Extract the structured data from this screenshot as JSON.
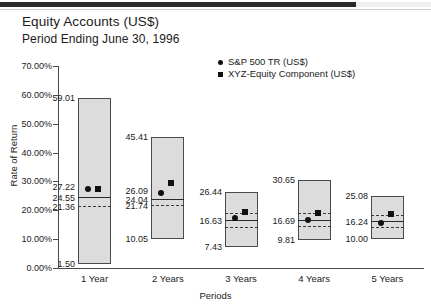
{
  "header": {
    "title": "Equity Accounts (US$)",
    "subtitle": "Period Ending June 30, 1996"
  },
  "chart_data": {
    "type": "bar",
    "title": "Equity Accounts (US$)",
    "subtitle": "Period Ending June 30, 1996",
    "xlabel": "Periods",
    "ylabel": "Rate of Return",
    "ylim": [
      0,
      70
    ],
    "ytick_values": [
      0,
      10,
      20,
      30,
      40,
      50,
      60,
      70
    ],
    "ytick_labels": [
      "0.00%",
      "10.00%",
      "20.00%",
      "30.00%",
      "40.00%",
      "50.00%",
      "60.00%",
      "70.00%"
    ],
    "grid": false,
    "legend_position": "top-right",
    "legend": [
      {
        "name": "S&P 500 TR (US$)",
        "marker": "circle",
        "color": "#111111"
      },
      {
        "name": "XYZ-Equity Component (US$)",
        "marker": "square",
        "color": "#111111"
      }
    ],
    "categories": [
      "1 Year",
      "2 Years",
      "3 Years",
      "4 Years",
      "5 Years"
    ],
    "bars": [
      {
        "category": "1 Year",
        "high": 59.01,
        "low": 1.5,
        "high_label": "59.01",
        "low_label": "1.50",
        "median_solid": 24.55,
        "median_solid_label": "24.55",
        "quartile_dashed": 21.36,
        "quartile_dashed_label": "21.36",
        "upper_dashed": null,
        "sp500": 27.22,
        "sp500_label": "27.22",
        "xyz": 27.22,
        "xyz_label": ""
      },
      {
        "category": "2 Years",
        "high": 45.41,
        "low": 10.05,
        "high_label": "45.41",
        "low_label": "10.05",
        "median_solid": 24.04,
        "median_solid_label": "24.04",
        "quartile_dashed": 21.74,
        "quartile_dashed_label": "21.74",
        "upper_dashed": null,
        "sp500": 26.09,
        "sp500_label": "26.09",
        "xyz": 29.4,
        "xyz_label": ""
      },
      {
        "category": "3 Years",
        "high": 26.44,
        "low": 7.43,
        "high_label": "26.44",
        "low_label": "7.43",
        "median_solid": 16.63,
        "median_solid_label": "16.63",
        "quartile_dashed": 14.3,
        "quartile_dashed_label": "",
        "upper_dashed": 18.9,
        "sp500": 17.4,
        "sp500_label": "",
        "xyz": 19.3,
        "xyz_label": ""
      },
      {
        "category": "4 Years",
        "high": 30.65,
        "low": 9.81,
        "high_label": "30.65",
        "low_label": "9.81",
        "median_solid": 16.69,
        "median_solid_label": "16.69",
        "quartile_dashed": 14.4,
        "quartile_dashed_label": "",
        "upper_dashed": 19.1,
        "sp500": 16.69,
        "sp500_label": "",
        "xyz": 19.0,
        "xyz_label": ""
      },
      {
        "category": "5 Years",
        "high": 25.08,
        "low": 10.0,
        "high_label": "25.08",
        "low_label": "10.00",
        "median_solid": 16.24,
        "median_solid_label": "16.24",
        "quartile_dashed": 14.2,
        "quartile_dashed_label": "",
        "upper_dashed": 18.4,
        "sp500": 15.6,
        "sp500_label": "",
        "xyz": 18.6,
        "xyz_label": ""
      }
    ]
  },
  "axis": {
    "y_title": "Rate of Return",
    "x_title": "Periods"
  }
}
